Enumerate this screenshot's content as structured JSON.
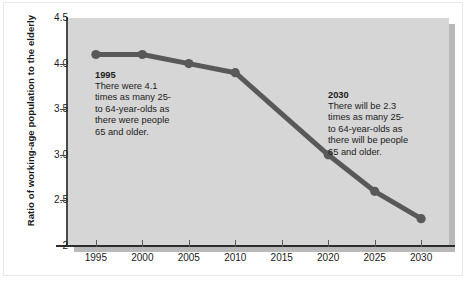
{
  "chart_data": {
    "type": "line",
    "title": "",
    "xlabel": "",
    "ylabel": "Ratio of working-age population to the elderly",
    "x": [
      1995,
      2000,
      2005,
      2010,
      2015,
      2020,
      2025,
      2030
    ],
    "values": [
      4.1,
      4.1,
      4.0,
      3.9,
      3.45,
      3.0,
      2.6,
      2.3
    ],
    "x_tick_labels": [
      "1995",
      "2000",
      "2005",
      "2010",
      "2015",
      "2020",
      "2025",
      "2030"
    ],
    "y_tick_labels": [
      "4.5",
      "4.0",
      "3.5",
      "3.0",
      "2.5",
      "2"
    ],
    "y_tick_values": [
      4.5,
      4.0,
      3.5,
      3.0,
      2.5,
      2.0
    ],
    "xlim": [
      1992.0,
      2033.0
    ],
    "ylim": [
      2.0,
      4.5
    ],
    "grid": false,
    "legend": "none",
    "markers_shown_at": [
      1995,
      2000,
      2005,
      2010,
      2020,
      2025,
      2030
    ],
    "line_color": "#595959",
    "marker_color": "#595959",
    "plot_background": "#d6d6d6",
    "page_background": "#ffffff"
  },
  "axes": {
    "y_title": "Ratio of working-age population to the elderly"
  },
  "annotations": [
    {
      "id": "annotation-1995",
      "year": "1995",
      "body": "There were 4.1\ntimes as many 25-\nto 64-year-olds as\nthere were people\n65 and older."
    },
    {
      "id": "annotation-2030",
      "year": "2030",
      "body": "There will be 2.3\ntimes as many 25-\nto 64-year-olds as\nthere will be people\n65 and older."
    }
  ]
}
